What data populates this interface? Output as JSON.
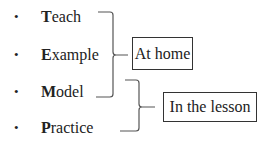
{
  "items": [
    {
      "initial": "T",
      "rest": "each"
    },
    {
      "initial": "E",
      "rest": "xample"
    },
    {
      "initial": "M",
      "rest": "odel"
    },
    {
      "initial": "P",
      "rest": "ractice"
    }
  ],
  "bullet": "•",
  "groups": [
    {
      "label": "At home",
      "covers": [
        "Teach",
        "Example",
        "Model"
      ]
    },
    {
      "label": "In the lesson",
      "covers": [
        "Model",
        "Practice"
      ]
    }
  ],
  "colors": {
    "text": "#222222",
    "bracket": "#555555",
    "box_border": "#333333"
  }
}
